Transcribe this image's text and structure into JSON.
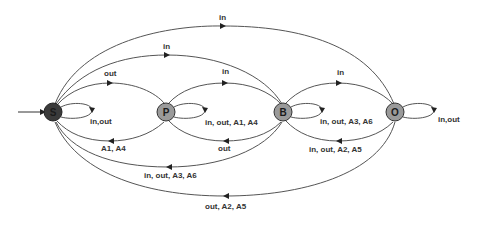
{
  "diagram": {
    "type": "state-machine",
    "initial_state": "S",
    "colors": {
      "edge": "#555555",
      "label": "#333333",
      "node_S_fill": "#3a3a3a",
      "node_fill": "#9a9a9a",
      "node_stroke": "#333333"
    },
    "nodes": [
      {
        "id": "S",
        "label": "S"
      },
      {
        "id": "P",
        "label": "P"
      },
      {
        "id": "B",
        "label": "B"
      },
      {
        "id": "O",
        "label": "O"
      }
    ],
    "edges": [
      {
        "from": "S",
        "to": "O",
        "label": "in"
      },
      {
        "from": "S",
        "to": "B",
        "label": "in"
      },
      {
        "from": "S",
        "to": "P",
        "label": "out"
      },
      {
        "from": "P",
        "to": "B",
        "label": "in"
      },
      {
        "from": "B",
        "to": "O",
        "label": "in"
      },
      {
        "from": "S",
        "to": "S",
        "label": "in,out"
      },
      {
        "from": "P",
        "to": "P",
        "label": "in, out, A1, A4"
      },
      {
        "from": "B",
        "to": "B",
        "label": "in, out, A3, A6"
      },
      {
        "from": "O",
        "to": "O",
        "label": "in,out"
      },
      {
        "from": "P",
        "to": "S",
        "label": "A1, A4"
      },
      {
        "from": "B",
        "to": "P",
        "label": "out"
      },
      {
        "from": "O",
        "to": "B",
        "label": "in, out, A2, A5"
      },
      {
        "from": "B",
        "to": "S",
        "label": "in, out, A3, A6"
      },
      {
        "from": "O",
        "to": "S",
        "label": "out, A2, A5"
      }
    ]
  }
}
